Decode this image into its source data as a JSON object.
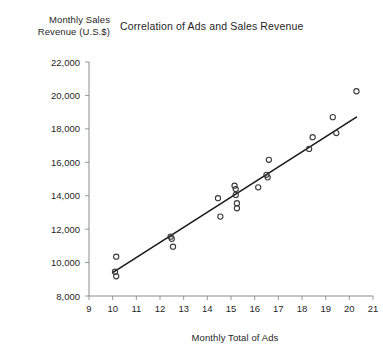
{
  "chart_data": {
    "type": "scatter",
    "title": "Correlation of Ads and Sales Revenue",
    "xlabel": "Monthly Total of Ads",
    "ylabel": "Monthly Sales\nRevenue (U.S.$)",
    "xlim": [
      9,
      21
    ],
    "ylim": [
      8000,
      22000
    ],
    "xticks": [
      9,
      10,
      11,
      12,
      13,
      14,
      15,
      16,
      17,
      18,
      19,
      20,
      21
    ],
    "xtick_labels": [
      "9",
      "10",
      "11",
      "12",
      "13",
      "14",
      "15",
      "16",
      "17",
      "18",
      "19",
      "20",
      "21"
    ],
    "yticks": [
      8000,
      10000,
      12000,
      14000,
      16000,
      18000,
      20000,
      22000
    ],
    "ytick_labels": [
      "8,000",
      "10,000",
      "12,000",
      "14,000",
      "16,000",
      "18,000",
      "20,000",
      "22,000"
    ],
    "grid": false,
    "legend": "none",
    "marker": "open-circle",
    "series": [
      {
        "name": "Monthly observations",
        "points": [
          [
            10.15,
            10350
          ],
          [
            10.1,
            9450
          ],
          [
            10.15,
            9180
          ],
          [
            12.45,
            11550
          ],
          [
            12.5,
            11420
          ],
          [
            12.55,
            10950
          ],
          [
            14.45,
            13850
          ],
          [
            14.55,
            12750
          ],
          [
            15.15,
            14600
          ],
          [
            15.2,
            14400
          ],
          [
            15.2,
            14050
          ],
          [
            15.25,
            13550
          ],
          [
            15.25,
            13250
          ],
          [
            16.15,
            14500
          ],
          [
            16.5,
            15250
          ],
          [
            16.55,
            15100
          ],
          [
            16.6,
            16150
          ],
          [
            18.3,
            16800
          ],
          [
            18.45,
            17500
          ],
          [
            19.3,
            18700
          ],
          [
            19.45,
            17750
          ],
          [
            20.3,
            20250
          ]
        ]
      }
    ],
    "trendline": {
      "name": "Linear fit",
      "x_start": 10.0,
      "y_start": 9400,
      "x_end": 20.3,
      "y_end": 18700
    }
  }
}
